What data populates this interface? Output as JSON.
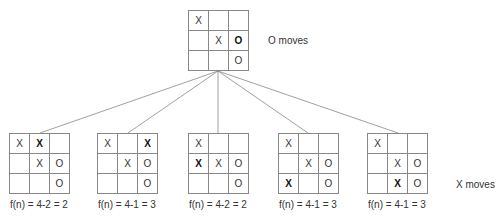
{
  "root": {
    "label": "O moves",
    "cells": [
      "X",
      "",
      "",
      "",
      "X",
      "O",
      "",
      "",
      "O"
    ],
    "bold": [
      false,
      false,
      false,
      false,
      false,
      true,
      false,
      false,
      false
    ]
  },
  "children_label": "X moves",
  "children": [
    {
      "cells": [
        "X",
        "X",
        "",
        "",
        "X",
        "O",
        "",
        "",
        "O"
      ],
      "bold": [
        false,
        true,
        false,
        false,
        false,
        false,
        false,
        false,
        false
      ],
      "caption": "f(n) = 4-2 = 2"
    },
    {
      "cells": [
        "X",
        "",
        "X",
        "",
        "X",
        "O",
        "",
        "",
        "O"
      ],
      "bold": [
        false,
        false,
        true,
        false,
        false,
        false,
        false,
        false,
        false
      ],
      "caption": "f(n) = 4-1 = 3"
    },
    {
      "cells": [
        "X",
        "",
        "",
        "X",
        "X",
        "O",
        "",
        "",
        "O"
      ],
      "bold": [
        false,
        false,
        false,
        true,
        false,
        false,
        false,
        false,
        false
      ],
      "caption": "f(n) = 4-2 = 2"
    },
    {
      "cells": [
        "X",
        "",
        "",
        "",
        "X",
        "O",
        "X",
        "",
        "O"
      ],
      "bold": [
        false,
        false,
        false,
        false,
        false,
        false,
        true,
        false,
        false
      ],
      "caption": "f(n) = 4-1 = 3"
    },
    {
      "cells": [
        "X",
        "",
        "",
        "",
        "X",
        "O",
        "",
        "X",
        "O"
      ],
      "bold": [
        false,
        false,
        false,
        false,
        false,
        false,
        false,
        true,
        false
      ],
      "caption": "f(n) = 4-1 = 3"
    }
  ]
}
